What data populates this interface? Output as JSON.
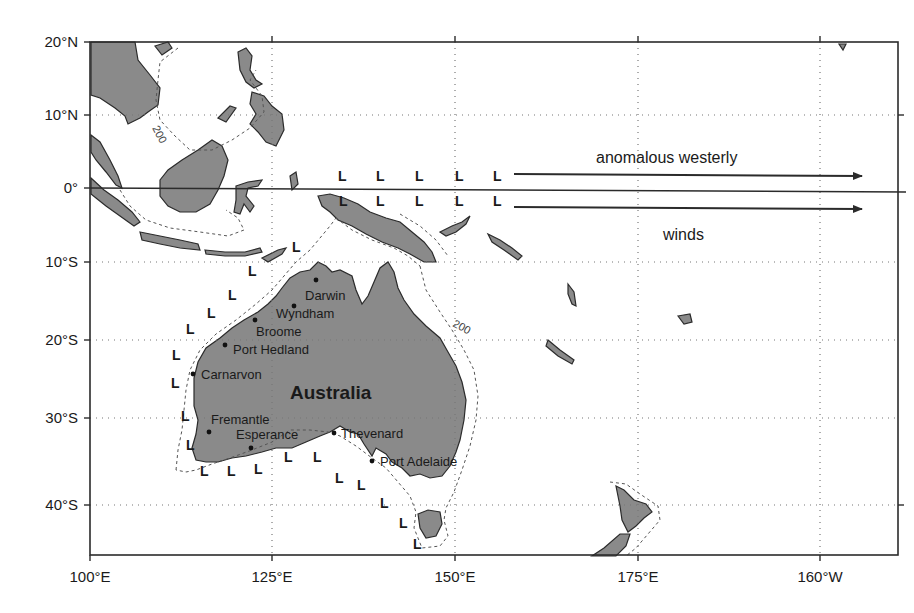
{
  "map": {
    "region": "Maritime Continent and Australia",
    "projection": "cylindrical equidistant",
    "extent": {
      "lon_min": "100°E",
      "lon_max": "157.5°W",
      "lat_min": "46°S",
      "lat_max": "20°N"
    },
    "axes": {
      "x_ticks": [
        "100°E",
        "125°E",
        "150°E",
        "175°E",
        "160°W"
      ],
      "y_ticks": [
        "20°N",
        "10°N",
        "0°",
        "10°S",
        "20°S",
        "30°S",
        "40°S"
      ]
    },
    "country_label": "Australia",
    "isobath_label": "200",
    "isobath_labels": [
      {
        "text": "200",
        "location": "South China Sea"
      },
      {
        "text": "200",
        "location": "off Queensland"
      }
    ],
    "cities": [
      {
        "name": "Darwin"
      },
      {
        "name": "Wyndham"
      },
      {
        "name": "Broome"
      },
      {
        "name": "Port Hedland"
      },
      {
        "name": "Carnarvon"
      },
      {
        "name": "Fremantle"
      },
      {
        "name": "Esperance"
      },
      {
        "name": "Thevenard"
      },
      {
        "name": "Port Adelaide"
      }
    ],
    "low_marker": "L",
    "annotation": {
      "line1": "anomalous westerly",
      "line2": "winds"
    },
    "colors": {
      "land": "#8a8a8a",
      "ocean": "#ffffff",
      "coastline": "#2b2b2b",
      "isobath": "#555555",
      "text": "#1a1a1a"
    }
  }
}
